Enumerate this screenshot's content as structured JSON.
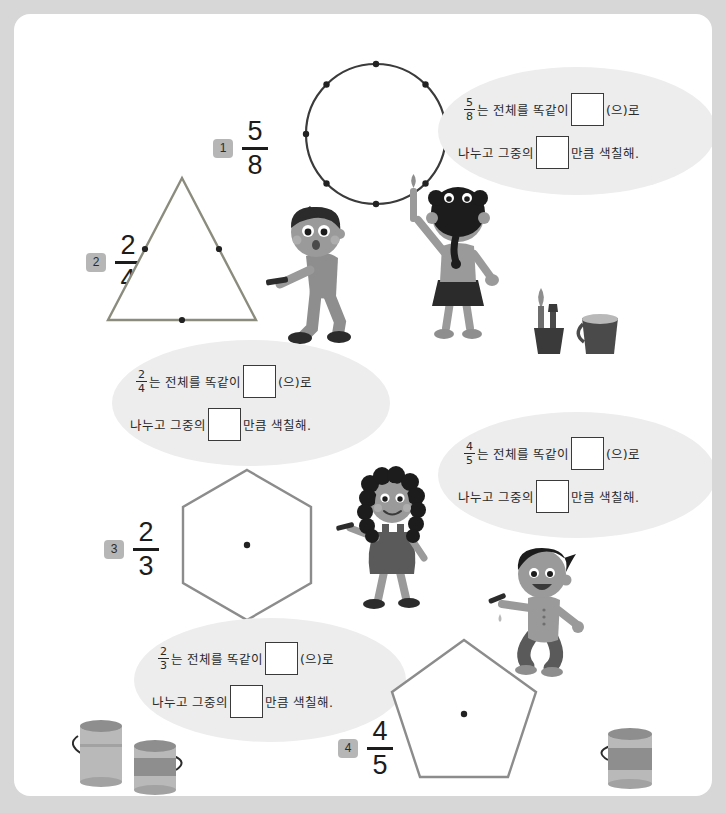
{
  "page": {
    "background_color": "#d7d7d7",
    "paper_color": "#ffffff"
  },
  "problems": [
    {
      "number": "1",
      "numerator": "5",
      "denominator": "8",
      "shape": "circle",
      "shape_label": "circle-eighths",
      "divisions": 8,
      "shape_color": "#3b3b3b"
    },
    {
      "number": "2",
      "numerator": "2",
      "denominator": "4",
      "shape": "triangle",
      "shape_label": "triangle-with-midpoints",
      "divisions": 3,
      "shape_color": "#8c8c7e"
    },
    {
      "number": "3",
      "numerator": "2",
      "denominator": "3",
      "shape": "hexagon",
      "shape_label": "hexagon-with-center",
      "divisions": 6,
      "shape_color": "#8c8c8c"
    },
    {
      "number": "4",
      "numerator": "4",
      "denominator": "5",
      "shape": "pentagon",
      "shape_label": "pentagon-with-center",
      "divisions": 5,
      "shape_color": "#8c8c8c"
    }
  ],
  "bubbles": [
    {
      "id": "bubble-5-8",
      "numerator": "5",
      "denominator": "8",
      "line1_before": "는 전체를 똑같이",
      "line1_after": "(으)로",
      "line2_before": "나누고 그중의",
      "line2_after": "만큼 색칠해."
    },
    {
      "id": "bubble-2-4",
      "numerator": "2",
      "denominator": "4",
      "line1_before": "는 전체를 똑같이",
      "line1_after": "(으)로",
      "line2_before": "나누고 그중의",
      "line2_after": "만큼 색칠해."
    },
    {
      "id": "bubble-4-5",
      "numerator": "4",
      "denominator": "5",
      "line1_before": "는 전체를 똑같이",
      "line1_after": "(으)로",
      "line2_before": "나누고 그중의",
      "line2_after": "만큼 색칠해."
    },
    {
      "id": "bubble-2-3",
      "numerator": "2",
      "denominator": "3",
      "line1_before": "는 전체를 똑같이",
      "line1_after": "(으)로",
      "line2_before": "나누고 그중의",
      "line2_after": "만큼 색칠해."
    }
  ],
  "illustrations": [
    {
      "name": "boy-with-brush-dark-hair"
    },
    {
      "name": "girl-with-braids-painting"
    },
    {
      "name": "brush-cup"
    },
    {
      "name": "water-bucket"
    },
    {
      "name": "girl-curly-hair"
    },
    {
      "name": "jumping-boy-with-brush"
    },
    {
      "name": "paint-can-tall-left"
    },
    {
      "name": "paint-can-short-left"
    },
    {
      "name": "paint-can-right"
    }
  ],
  "colors": {
    "badge": "#b6b6b6",
    "bubble": "#ededed",
    "ink": "#2a2a2a",
    "skin": "#9a9a9a",
    "hair_dark": "#2b2b2b",
    "clothes_gray": "#8e8e8e"
  }
}
